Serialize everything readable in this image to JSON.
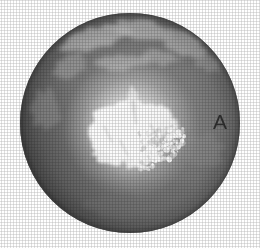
{
  "figure": {
    "kind": "grayscale-satellite-globe",
    "panel_label": "A",
    "background_color": "#ffffff",
    "width": 260,
    "height": 248
  },
  "globe": {
    "center_x": 130,
    "center_y": 123,
    "radius": 110,
    "ocean_color": "#7c7c7c",
    "ocean_dark_color": "#636363",
    "land_color": "#989898",
    "land_light_color": "#ababab",
    "ice_color": "#fbfbfb",
    "ice_mid_color": "#e2e2e2",
    "terminator_shadow_color": "#4e4e4e",
    "limb_color": "#8a8a8a"
  },
  "chart_data": {
    "type": "heatmap",
    "title": "",
    "xlabel": "",
    "ylabel": "",
    "legend": [],
    "annotations": [
      {
        "text": "A",
        "x": 220,
        "y": 122
      }
    ],
    "projection": "orthographic-polar",
    "grid": false,
    "features": [
      {
        "name": "polar-ice-cap",
        "tone": "white",
        "center": [
          130,
          128
        ],
        "extent": "large-central"
      },
      {
        "name": "fragmented-sea-ice",
        "tone": "white-speckled",
        "center": [
          163,
          147
        ],
        "extent": "medium-right-lower"
      },
      {
        "name": "ice-tongue",
        "tone": "white",
        "center": [
          152,
          120
        ],
        "extent": "small-right"
      },
      {
        "name": "landmass-upper",
        "tone": "light-gray",
        "center": [
          120,
          50
        ],
        "extent": "band-upper"
      },
      {
        "name": "landmass-upper-right",
        "tone": "light-gray",
        "center": [
          185,
          45
        ],
        "extent": "patch"
      },
      {
        "name": "ocean",
        "tone": "mid-gray",
        "center": [
          130,
          123
        ],
        "extent": "full-disc"
      },
      {
        "name": "limb-shadow",
        "tone": "dark-gray",
        "center": [
          70,
          200
        ],
        "extent": "lower-left-arc"
      }
    ]
  }
}
